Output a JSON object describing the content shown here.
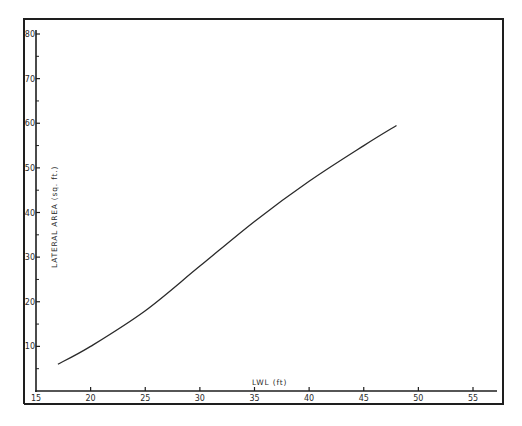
{
  "chart_data": {
    "type": "line",
    "title": "",
    "xlabel": "LWL (ft)",
    "ylabel": "LATERAL AREA (sq. ft.)",
    "xlim": [
      15,
      57
    ],
    "ylim": [
      0,
      81
    ],
    "grid": false,
    "legend": null,
    "x_ticks": [
      15,
      20,
      25,
      30,
      35,
      40,
      45,
      50,
      55
    ],
    "x_tick_labels": [
      "15",
      "20",
      "25",
      "30",
      "35",
      "40",
      "45",
      "50",
      "55"
    ],
    "y_ticks": [
      10,
      20,
      30,
      40,
      50,
      60,
      70,
      80
    ],
    "y_tick_labels": [
      "10",
      "20",
      "30",
      "40",
      "50",
      "60",
      "70",
      "80"
    ],
    "y_minor_ticks": [
      5,
      15,
      25,
      35,
      45,
      55,
      65,
      75
    ],
    "series": [
      {
        "name": "Lateral area vs LWL",
        "x": [
          17,
          20,
          25,
          30,
          35,
          40,
          45,
          48
        ],
        "y": [
          6,
          10,
          18,
          28,
          38,
          47,
          55,
          59.5
        ]
      }
    ]
  },
  "colors": {
    "line": "#2a2a2a",
    "frame": "#1e1e1e",
    "background": "#ffffff"
  }
}
